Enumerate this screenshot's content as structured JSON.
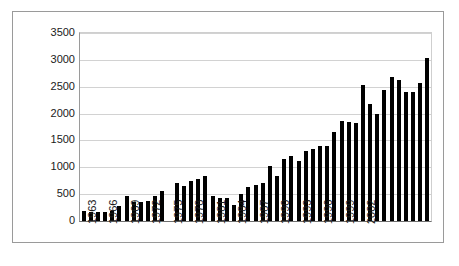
{
  "figure": {
    "caption": ""
  },
  "chart_data": {
    "type": "bar",
    "title": "",
    "subtitle": "",
    "xlabel": "",
    "ylabel": "",
    "ylim": [
      0,
      3500
    ],
    "yticks": [
      0,
      500,
      1000,
      1500,
      2000,
      2500,
      3000,
      3500
    ],
    "ytick_labels": [
      "0",
      "500",
      "1000",
      "1500",
      "2000",
      "2500",
      "3000",
      "3500"
    ],
    "grid": true,
    "legend": null,
    "bar_color": "#000000",
    "xtick_labels": [
      "1963",
      "1966",
      "1969",
      "1972",
      "1975",
      "1978",
      "1981",
      "1984",
      "1987",
      "1990",
      "1993",
      "1996",
      "1999",
      "2002"
    ],
    "xtick_interval_years": 3,
    "categories": [
      "1963",
      "1964",
      "1965",
      "1966",
      "1967",
      "1968",
      "1969",
      "1970",
      "1971",
      "1972",
      "1973",
      "1974",
      "1975",
      "1976",
      "1977",
      "1978",
      "1979",
      "1980",
      "1981",
      "1982",
      "1983",
      "1984",
      "1985",
      "1986",
      "1987",
      "1988",
      "1989",
      "1990",
      "1991",
      "1992",
      "1993",
      "1994",
      "1995",
      "1996",
      "1997",
      "1998",
      "1999",
      "2000",
      "2001",
      "2002",
      "2003",
      "2004"
    ],
    "values": [
      185,
      165,
      170,
      175,
      180,
      275,
      465,
      355,
      360,
      370,
      470,
      555,
      0,
      700,
      660,
      745,
      775,
      830,
      465,
      435,
      420,
      300,
      510,
      630,
      680,
      710,
      1020,
      845,
      1155,
      1220,
      1115,
      1300,
      1335,
      1395,
      1395,
      1665,
      1860,
      1840,
      1820,
      2540,
      2175,
      2000
    ],
    "values_tail": [
      2440,
      2690,
      2620,
      2400,
      2395,
      2575,
      3040
    ]
  }
}
